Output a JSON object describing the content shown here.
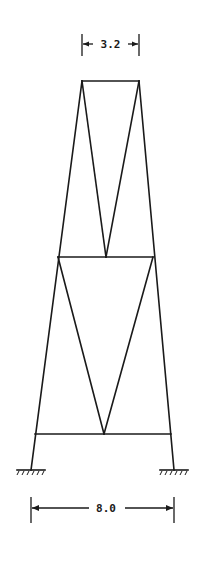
{
  "figure": {
    "type": "truss-frame",
    "top_width_label": "3.2",
    "base_width_label": "8.0",
    "panels": 2,
    "bracing": "V-bracing in each panel, apex at lower beam midpoint",
    "supports": [
      "fixed-left",
      "fixed-right"
    ],
    "line_color": "#1a1a1a",
    "background": "#ffffff"
  }
}
